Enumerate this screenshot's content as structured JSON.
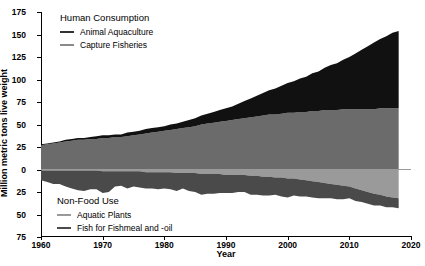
{
  "chart_data": {
    "type": "area",
    "stacked": true,
    "title": "",
    "xlabel": "Year",
    "ylabel": "Million metric tons live weight",
    "xlim": [
      1960,
      2020
    ],
    "ylim": [
      -75,
      175
    ],
    "xticks": [
      1960,
      1970,
      1980,
      1990,
      2000,
      2010,
      2020
    ],
    "yticks": [
      175,
      150,
      125,
      100,
      75,
      50,
      25,
      0,
      -25,
      -50,
      -75
    ],
    "ytick_labels": [
      "175",
      "150",
      "125",
      "100",
      "75",
      "50",
      "25",
      "0",
      "25",
      "50",
      "75"
    ],
    "grid": false,
    "legend_position": "inside-upper-left and inside-lower-left",
    "x": [
      1960,
      1961,
      1962,
      1963,
      1964,
      1965,
      1966,
      1967,
      1968,
      1969,
      1970,
      1971,
      1972,
      1973,
      1974,
      1975,
      1976,
      1977,
      1978,
      1979,
      1980,
      1981,
      1982,
      1983,
      1984,
      1985,
      1986,
      1987,
      1988,
      1989,
      1990,
      1991,
      1992,
      1993,
      1994,
      1995,
      1996,
      1997,
      1998,
      1999,
      2000,
      2001,
      2002,
      2003,
      2004,
      2005,
      2006,
      2007,
      2008,
      2009,
      2010,
      2011,
      2012,
      2013,
      2014,
      2015,
      2016,
      2017,
      2018
    ],
    "series": [
      {
        "name": "Capture Fisheries",
        "group": "Human Consumption",
        "direction": "positive",
        "color": "#6b6b6b",
        "values": [
          27,
          28,
          29,
          30,
          31,
          32,
          33,
          33,
          34,
          34,
          35,
          35,
          36,
          36,
          37,
          38,
          39,
          40,
          41,
          42,
          43,
          44,
          45,
          46,
          47,
          48,
          50,
          51,
          52,
          53,
          54,
          55,
          56,
          57,
          58,
          59,
          60,
          61,
          61,
          62,
          63,
          63,
          64,
          64,
          65,
          65,
          66,
          66,
          66,
          67,
          67,
          67,
          67,
          67,
          67,
          68,
          68,
          68,
          68
        ]
      },
      {
        "name": "Animal Aquaculture",
        "group": "Human Consumption",
        "direction": "positive",
        "color": "#111111",
        "values": [
          1,
          1,
          1,
          1,
          2,
          2,
          2,
          2,
          2,
          3,
          3,
          3,
          3,
          3,
          4,
          4,
          4,
          5,
          5,
          5,
          5,
          6,
          6,
          7,
          8,
          9,
          10,
          11,
          12,
          13,
          14,
          15,
          17,
          19,
          21,
          23,
          25,
          27,
          29,
          31,
          33,
          35,
          37,
          39,
          42,
          44,
          47,
          50,
          52,
          55,
          58,
          62,
          66,
          70,
          74,
          77,
          80,
          84,
          86
        ]
      },
      {
        "name": "Aquatic Plants",
        "group": "Non-Food Use",
        "direction": "negative",
        "color": "#9a9a9a",
        "values": [
          1,
          1,
          1,
          1,
          1,
          1,
          1,
          1,
          1,
          1,
          2,
          2,
          2,
          2,
          2,
          2,
          2,
          3,
          3,
          3,
          3,
          3,
          4,
          4,
          4,
          4,
          5,
          5,
          5,
          5,
          6,
          6,
          6,
          6,
          7,
          7,
          8,
          8,
          9,
          9,
          10,
          10,
          11,
          12,
          13,
          14,
          15,
          16,
          17,
          18,
          19,
          21,
          23,
          25,
          27,
          28,
          30,
          31,
          32
        ]
      },
      {
        "name": "Fish for Fishmeal and -oil",
        "group": "Non-Food Use",
        "direction": "negative",
        "color": "#4a4a4a",
        "values": [
          11,
          13,
          15,
          15,
          18,
          20,
          22,
          23,
          21,
          21,
          24,
          23,
          17,
          16,
          19,
          17,
          18,
          18,
          18,
          19,
          18,
          19,
          20,
          17,
          20,
          21,
          23,
          22,
          22,
          21,
          20,
          20,
          19,
          19,
          21,
          21,
          21,
          21,
          19,
          21,
          21,
          19,
          19,
          18,
          18,
          18,
          17,
          16,
          16,
          15,
          13,
          14,
          13,
          13,
          13,
          12,
          12,
          11,
          11
        ]
      }
    ]
  },
  "axes": {
    "y_title": "Million metric tons live weight",
    "x_title": "Year"
  },
  "legend_top": {
    "title": "Human Consumption",
    "items": [
      {
        "label": "Animal Aquaculture",
        "color": "#333333"
      },
      {
        "label": "Capture Fisheries",
        "color": "#8a8a8a"
      }
    ]
  },
  "legend_bottom": {
    "title": "Non-Food Use",
    "items": [
      {
        "label": "Aquatic Plants",
        "color": "#9a9a9a"
      },
      {
        "label": "Fish for Fishmeal and -oil",
        "color": "#4a4a4a"
      }
    ]
  }
}
